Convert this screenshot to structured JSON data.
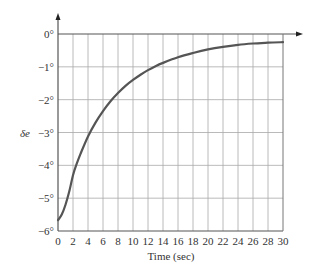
{
  "chart_data": {
    "type": "line",
    "title": "",
    "xlabel": "Time (sec)",
    "ylabel": "δe",
    "xlim": [
      0,
      30
    ],
    "ylim": [
      -6,
      0
    ],
    "grid": true,
    "x_ticks": [
      0,
      2,
      4,
      6,
      8,
      10,
      12,
      14,
      16,
      18,
      20,
      22,
      24,
      26,
      28,
      30
    ],
    "x_tick_labels": [
      "0",
      "2",
      "4",
      "6",
      "8",
      "10",
      "12",
      "14",
      "16",
      "18",
      "20",
      "22",
      "24",
      "26",
      "28",
      "30"
    ],
    "y_ticks": [
      0,
      -1,
      -2,
      -3,
      -4,
      -5,
      -6
    ],
    "y_tick_labels": [
      "0°",
      "−1°",
      "−2°",
      "−3°",
      "−4°",
      "−5°",
      "−6°"
    ],
    "series": [
      {
        "name": "δe",
        "color": "#555555",
        "x": [
          0,
          0.5,
          1,
          1.5,
          2,
          2.5,
          3,
          4,
          5,
          6,
          7,
          8,
          9,
          10,
          11,
          12,
          13,
          14,
          16,
          18,
          20,
          22,
          24,
          26,
          28,
          30
        ],
        "y": [
          -5.67,
          -5.5,
          -5.2,
          -4.8,
          -4.3,
          -3.95,
          -3.65,
          -3.12,
          -2.7,
          -2.35,
          -2.05,
          -1.8,
          -1.58,
          -1.4,
          -1.24,
          -1.1,
          -0.98,
          -0.88,
          -0.71,
          -0.58,
          -0.47,
          -0.39,
          -0.33,
          -0.29,
          -0.26,
          -0.25
        ]
      }
    ]
  },
  "labels": {
    "x_axis": "Time (sec)",
    "y_axis": "δe"
  },
  "colors": {
    "grid": "#a8a8a8",
    "axis": "#555555",
    "curve": "#555555"
  }
}
